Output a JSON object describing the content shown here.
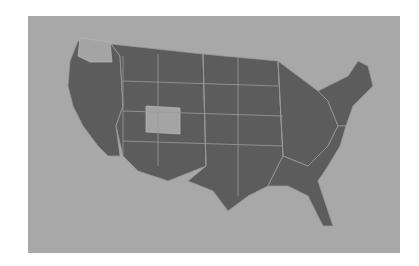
{
  "map": {
    "title": "United States map",
    "background_color": "#a8a8a8",
    "state_fill": "#5c5c5c",
    "border_color": "#9a9a9a",
    "highlight_fill": "#a4a4a4",
    "highlighted_states": [
      "Washington",
      "Colorado"
    ]
  }
}
